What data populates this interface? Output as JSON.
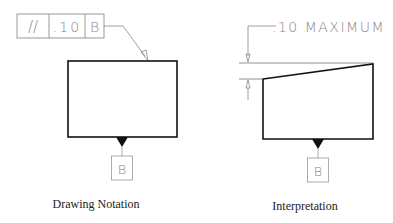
{
  "drawing_notation": {
    "feature_control_frame": {
      "symbol": "//",
      "tolerance": ".10",
      "datum": "B"
    },
    "datum_label": "B",
    "caption": "Drawing Notation"
  },
  "interpretation": {
    "dimension_text": ".10 MAXIMUM",
    "datum_label": "B",
    "caption": "Interpretation"
  },
  "colors": {
    "outline": "#111111",
    "thin_line": "#888888"
  }
}
